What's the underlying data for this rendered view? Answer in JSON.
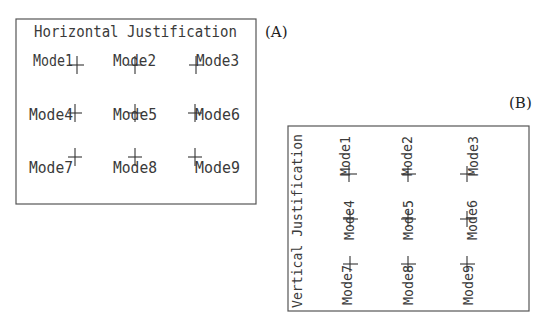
{
  "panels": [
    {
      "id": "A",
      "panel_label": "(A)",
      "title": "Horizontal Justification",
      "orientation": "horizontal",
      "modes": [
        {
          "label": "Mode1",
          "justification": "bottom-right"
        },
        {
          "label": "Mode2",
          "justification": "bottom-center"
        },
        {
          "label": "Mode3",
          "justification": "bottom-left"
        },
        {
          "label": "Mode4",
          "justification": "middle-right"
        },
        {
          "label": "Mode5",
          "justification": "middle-center"
        },
        {
          "label": "Mode6",
          "justification": "middle-left"
        },
        {
          "label": "Mode7",
          "justification": "top-right"
        },
        {
          "label": "Mode8",
          "justification": "top-center"
        },
        {
          "label": "Mode9",
          "justification": "top-left"
        }
      ]
    },
    {
      "id": "B",
      "panel_label": "(B)",
      "title": "Vertical Justification",
      "orientation": "vertical",
      "modes": [
        {
          "label": "Mode1",
          "justification": "bottom-right"
        },
        {
          "label": "Mode2",
          "justification": "bottom-center"
        },
        {
          "label": "Mode3",
          "justification": "bottom-left"
        },
        {
          "label": "Mode4",
          "justification": "middle-right"
        },
        {
          "label": "Mode5",
          "justification": "middle-center"
        },
        {
          "label": "Mode6",
          "justification": "middle-left"
        },
        {
          "label": "Mode7",
          "justification": "top-right"
        },
        {
          "label": "Mode8",
          "justification": "top-center"
        },
        {
          "label": "Mode9",
          "justification": "top-left"
        }
      ]
    }
  ]
}
